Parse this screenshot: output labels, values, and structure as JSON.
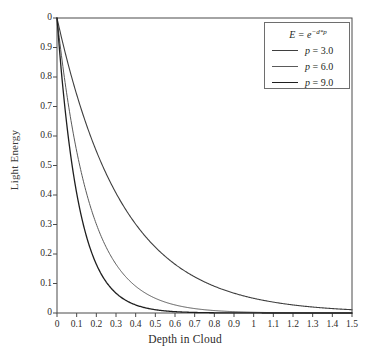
{
  "chart_data": {
    "type": "line",
    "title": "",
    "xlabel": "Depth in Cloud",
    "ylabel": "Light Energy",
    "xlim": [
      0,
      1.5
    ],
    "ylim": [
      0,
      1
    ],
    "grid": false,
    "legend_position": "top-right",
    "legend_title": "E = e^-d*p",
    "legend_title_parts": {
      "base": "E = e",
      "exponent": "−d*p"
    },
    "xticks": [
      "0",
      "0.1",
      "0.2",
      "0.3",
      "0.4",
      "0.5",
      "0.6",
      "0.7",
      "0.8",
      "0.9",
      "1",
      "1.1",
      "1.2",
      "1.3",
      "1.4",
      "1.5"
    ],
    "xtick_values": [
      0,
      0.1,
      0.2,
      0.3,
      0.4,
      0.5,
      0.6,
      0.7,
      0.8,
      0.9,
      1.0,
      1.1,
      1.2,
      1.3,
      1.4,
      1.5
    ],
    "yticks": [
      "0",
      "0.9",
      "0.8",
      "0.7",
      "0.6",
      "0.5",
      "0.4",
      "0.3",
      "0.2",
      "0.1",
      "0"
    ],
    "ytick_values": [
      1.0,
      0.9,
      0.8,
      0.7,
      0.6,
      0.5,
      0.4,
      0.3,
      0.2,
      0.1,
      0
    ],
    "x": [
      0,
      0.05,
      0.1,
      0.15,
      0.2,
      0.25,
      0.3,
      0.35,
      0.4,
      0.45,
      0.5,
      0.55,
      0.6,
      0.65,
      0.7,
      0.75,
      0.8,
      0.85,
      0.9,
      0.95,
      1.0,
      1.05,
      1.1,
      1.15,
      1.2,
      1.25,
      1.3,
      1.35,
      1.4,
      1.45,
      1.5
    ],
    "series": [
      {
        "name": "p = 3.0",
        "p": 3.0,
        "color": "#3f3f3f",
        "linewidth": 1.1,
        "values": [
          1.0,
          0.861,
          0.741,
          0.638,
          0.549,
          0.472,
          0.407,
          0.35,
          0.301,
          0.259,
          0.223,
          0.192,
          0.165,
          0.142,
          0.122,
          0.105,
          0.091,
          0.078,
          0.067,
          0.058,
          0.05,
          0.043,
          0.037,
          0.032,
          0.027,
          0.024,
          0.02,
          0.017,
          0.015,
          0.013,
          0.011
        ]
      },
      {
        "name": "p = 6.0",
        "p": 6.0,
        "color": "#5a5a5a",
        "linewidth": 1.0,
        "values": [
          1.0,
          0.741,
          0.549,
          0.407,
          0.301,
          0.223,
          0.165,
          0.122,
          0.091,
          0.067,
          0.05,
          0.037,
          0.027,
          0.02,
          0.015,
          0.011,
          0.008,
          0.006,
          0.0045,
          0.0033,
          0.0025,
          0.0018,
          0.0014,
          0.001,
          0.00075,
          0.00055,
          0.00041,
          0.0003,
          0.00022,
          0.00017,
          0.00012
        ]
      },
      {
        "name": "p = 9.0",
        "p": 9.0,
        "color": "#1f1f1f",
        "linewidth": 1.3,
        "values": [
          1.0,
          0.638,
          0.407,
          0.259,
          0.165,
          0.105,
          0.067,
          0.043,
          0.027,
          0.017,
          0.011,
          0.007,
          0.0045,
          0.0029,
          0.0018,
          0.0012,
          0.00075,
          0.00048,
          0.0003,
          0.00019,
          0.00012,
          8e-05,
          5e-05,
          3e-05,
          2e-05,
          1e-05,
          1e-05,
          0.0,
          0.0,
          0.0,
          0.0
        ]
      }
    ],
    "legend_entries": [
      {
        "label": "p = 3.0",
        "var": "p",
        "rest": " = 3.0",
        "color": "#3f3f3f",
        "linewidth": 1.1
      },
      {
        "label": "p = 6.0",
        "var": "p",
        "rest": " = 6.0",
        "color": "#5a5a5a",
        "linewidth": 1.0
      },
      {
        "label": "p = 9.0",
        "var": "p",
        "rest": " = 9.0",
        "color": "#1f1f1f",
        "linewidth": 1.3
      }
    ],
    "axis_color": "#4a4a4a",
    "background": "#ffffff"
  }
}
